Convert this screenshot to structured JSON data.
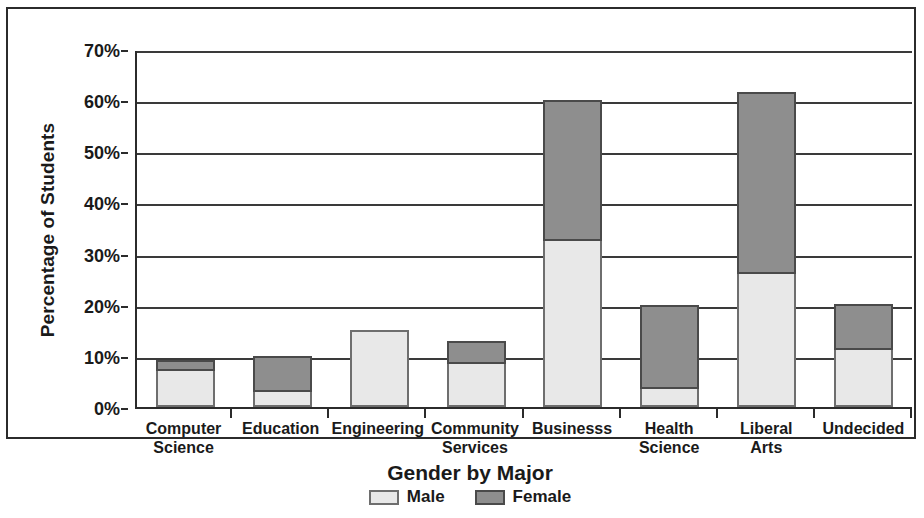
{
  "chart_data": {
    "type": "bar",
    "stacked": true,
    "title": "",
    "xlabel": "Gender by Major",
    "ylabel": "Percentage of Students",
    "categories": [
      "Computer\nScience",
      "Education",
      "Engineering",
      "Community\nServices",
      "Businesss",
      "Health\nScience",
      "Liberal\nArts",
      "Undecided"
    ],
    "series": [
      {
        "name": "Male",
        "color": "#e8e8e8",
        "values": [
          7.0,
          3.0,
          15.0,
          8.5,
          32.5,
          3.5,
          26.0,
          11.2
        ]
      },
      {
        "name": "Female",
        "color": "#8e8e8e",
        "values": [
          2.2,
          7.0,
          0.0,
          4.5,
          27.5,
          16.5,
          35.5,
          9.0
        ]
      }
    ],
    "totals": [
      9.2,
      10.0,
      15.0,
      13.0,
      60.0,
      20.0,
      61.5,
      20.2
    ],
    "ylim": [
      0,
      70
    ],
    "yticks": [
      0,
      10,
      20,
      30,
      40,
      50,
      60,
      70
    ],
    "ytick_labels": [
      "0%",
      "10%",
      "20%",
      "30%",
      "40%",
      "50%",
      "60%",
      "70%"
    ],
    "grid": true,
    "legend_position": "bottom"
  },
  "legend": {
    "items": [
      {
        "label": "Male",
        "swatch": "male"
      },
      {
        "label": "Female",
        "swatch": "female"
      }
    ]
  }
}
